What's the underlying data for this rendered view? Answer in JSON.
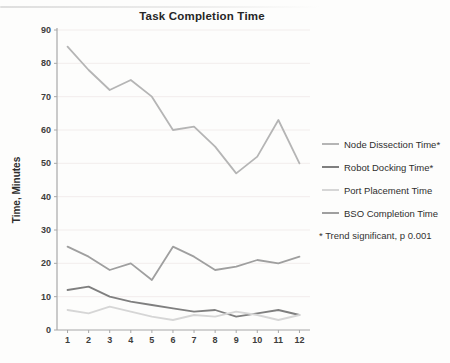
{
  "chart_data": {
    "type": "line",
    "title": "Task Completion Time",
    "xlabel": "",
    "ylabel": "Time, Minutes",
    "annotation": "* Trend significant, p 0.001",
    "x": [
      1,
      2,
      3,
      4,
      5,
      6,
      7,
      8,
      9,
      10,
      11,
      12
    ],
    "ylim": [
      0,
      90
    ],
    "ytick_step": 10,
    "grid": true,
    "legend_position": "right",
    "axis_color": "#a8a8a8",
    "gridline_color": "#f2edec",
    "series": [
      {
        "name": "Node Dissection Time*",
        "color": "#b5b5b5",
        "values": [
          85,
          78,
          72,
          75,
          70,
          60,
          61,
          55,
          47,
          52,
          63,
          50
        ]
      },
      {
        "name": "Robot Docking Time*",
        "color": "#7f7f7f",
        "values": [
          12,
          13,
          10,
          8.5,
          7.5,
          6.5,
          5.5,
          6,
          4,
          5,
          6,
          4.5
        ]
      },
      {
        "name": "Port Placement Time",
        "color": "#d6d6d6",
        "values": [
          6,
          5,
          7,
          5.5,
          4,
          3,
          4.5,
          4,
          5.5,
          4.5,
          3,
          4.5
        ]
      },
      {
        "name": "BSO Completion Time",
        "color": "#9f9f9f",
        "values": [
          25,
          22,
          18,
          20,
          15,
          25,
          22,
          18,
          19,
          21,
          20,
          22
        ]
      }
    ]
  }
}
